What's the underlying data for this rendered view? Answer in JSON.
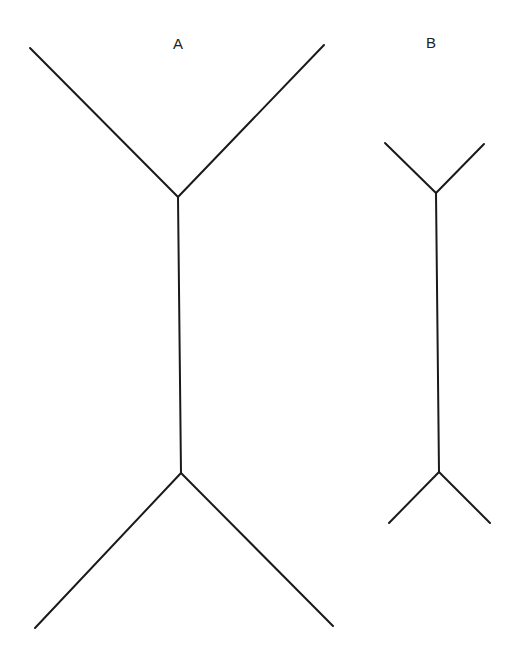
{
  "stroke_color": "#1a1a1a",
  "background_color": "#ffffff",
  "figures": [
    {
      "id": "A",
      "label": "A",
      "label_pos": [
        178,
        43
      ],
      "shaft": [
        [
          178,
          197
        ],
        [
          181,
          473
        ]
      ],
      "fins": [
        [
          [
            30,
            48
          ],
          [
            178,
            197
          ]
        ],
        [
          [
            324,
            45
          ],
          [
            178,
            197
          ]
        ],
        [
          [
            181,
            473
          ],
          [
            35,
            628
          ]
        ],
        [
          [
            181,
            473
          ],
          [
            333,
            626
          ]
        ]
      ],
      "fin_orientation": "outward (tails)"
    },
    {
      "id": "B",
      "label": "B",
      "label_pos": [
        431,
        42
      ],
      "shaft": [
        [
          436,
          193
        ],
        [
          439,
          472
        ]
      ],
      "fins": [
        [
          [
            385,
            143
          ],
          [
            436,
            193
          ]
        ],
        [
          [
            484,
            144
          ],
          [
            436,
            193
          ]
        ],
        [
          [
            439,
            472
          ],
          [
            389,
            523
          ]
        ],
        [
          [
            439,
            472
          ],
          [
            490,
            523
          ]
        ]
      ],
      "fin_orientation": "outward (tails)"
    }
  ]
}
